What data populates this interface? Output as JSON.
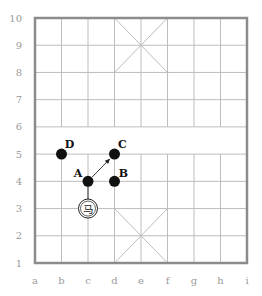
{
  "diagram": {
    "type": "xiangqi-board-fragment",
    "columns": [
      "a",
      "b",
      "c",
      "d",
      "e",
      "f",
      "g",
      "h",
      "i"
    ],
    "rows": [
      "1",
      "2",
      "3",
      "4",
      "5",
      "6",
      "7",
      "8",
      "9",
      "10"
    ],
    "colors": {
      "border": "#8c8c8c",
      "grid": "#bdbdbd",
      "diag": "#bdbdbd",
      "piece": "#111111",
      "label": "#9a9a9a"
    },
    "palaces": [
      {
        "from": "d10",
        "to": "f8"
      },
      {
        "from": "f10",
        "to": "d8"
      },
      {
        "from": "d3",
        "to": "f1"
      },
      {
        "from": "f3",
        "to": "d1"
      }
    ],
    "points": [
      {
        "label": "A",
        "at": "c4"
      },
      {
        "label": "B",
        "at": "d4"
      },
      {
        "label": "C",
        "at": "d5"
      },
      {
        "label": "D",
        "at": "b5"
      }
    ],
    "piece": {
      "at": "c3",
      "glyph": "马",
      "name": "horse"
    },
    "arrow": {
      "from": "A",
      "to": "C"
    }
  }
}
